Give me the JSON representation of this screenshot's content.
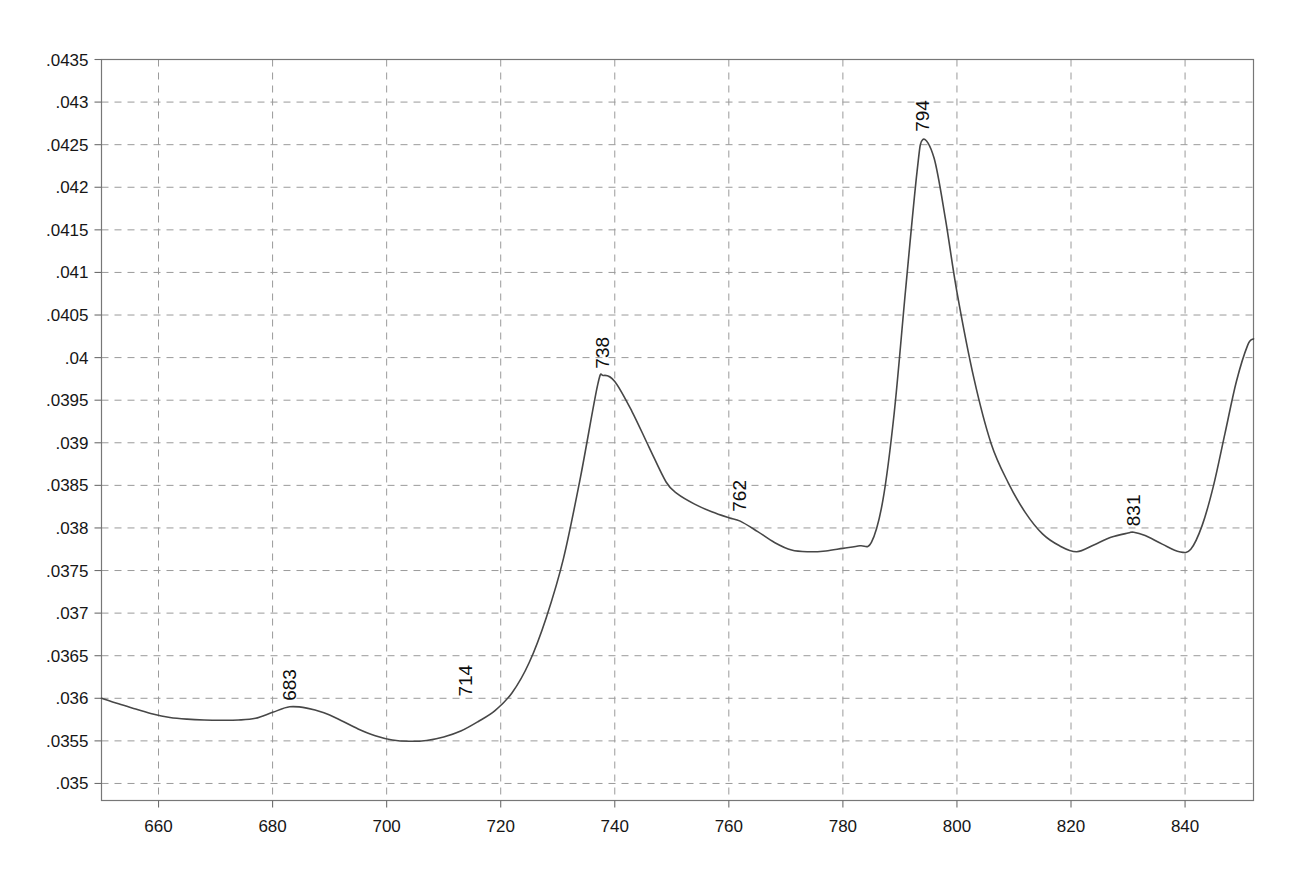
{
  "chart_data": {
    "type": "line",
    "title": "",
    "subtitle": "",
    "xlabel": "",
    "ylabel": "",
    "xlim": [
      650,
      852
    ],
    "ylim": [
      0.0348,
      0.0435
    ],
    "grid": true,
    "legend": null,
    "x_ticks": [
      660,
      680,
      700,
      720,
      740,
      760,
      780,
      800,
      820,
      840
    ],
    "x_tick_labels": [
      "660",
      "680",
      "700",
      "720",
      "740",
      "760",
      "780",
      "800",
      "820",
      "840"
    ],
    "y_ticks": [
      0.035,
      0.0355,
      0.036,
      0.0365,
      0.037,
      0.0375,
      0.038,
      0.0385,
      0.039,
      0.0395,
      0.04,
      0.0405,
      0.041,
      0.0415,
      0.042,
      0.0425,
      0.043,
      0.0435
    ],
    "y_tick_labels": [
      ".035",
      ".0355",
      ".036",
      ".0365",
      ".037",
      ".0375",
      ".038",
      ".0385",
      ".039",
      ".0395",
      ".04",
      ".0405",
      ".041",
      ".0415",
      ".042",
      ".0425",
      ".043",
      ".0435"
    ],
    "annotations": [
      {
        "label": "683",
        "x": 683,
        "y": 0.0359,
        "rotation": -90
      },
      {
        "label": "714",
        "x": 714,
        "y": 0.03595,
        "rotation": -90
      },
      {
        "label": "738",
        "x": 738,
        "y": 0.0398,
        "rotation": -90
      },
      {
        "label": "762",
        "x": 762,
        "y": 0.03812,
        "rotation": -90
      },
      {
        "label": "794",
        "x": 794,
        "y": 0.04258,
        "rotation": -90
      },
      {
        "label": "831",
        "x": 831,
        "y": 0.03795,
        "rotation": -90
      }
    ],
    "series": [
      {
        "name": "spectrum",
        "color": "#474747",
        "x": [
          650,
          653,
          656,
          659,
          662,
          665,
          668,
          671,
          674,
          677,
          680,
          683,
          686,
          689,
          692,
          695,
          698,
          701,
          704,
          707,
          710,
          713,
          716,
          719,
          722,
          725,
          728,
          731,
          734,
          737,
          738,
          740,
          743,
          746,
          749,
          751,
          754,
          757,
          760,
          762,
          765,
          768,
          771,
          774,
          777,
          780,
          783,
          785,
          787,
          789,
          791,
          793,
          794,
          796,
          798,
          800,
          803,
          806,
          809,
          812,
          815,
          818,
          821,
          824,
          827,
          830,
          831,
          833,
          836,
          839,
          841,
          843,
          845,
          847,
          849,
          851,
          852
        ],
        "y": [
          0.036,
          0.035935,
          0.035875,
          0.035815,
          0.035775,
          0.035755,
          0.035745,
          0.035742,
          0.035745,
          0.035765,
          0.035835,
          0.0359,
          0.035885,
          0.03583,
          0.03574,
          0.03564,
          0.03556,
          0.03551,
          0.035495,
          0.035505,
          0.035545,
          0.035615,
          0.035725,
          0.035855,
          0.036065,
          0.03642,
          0.03695,
          0.03764,
          0.0386,
          0.03968,
          0.03979,
          0.03972,
          0.03937,
          0.03895,
          0.03854,
          0.0384,
          0.03828,
          0.03819,
          0.03812,
          0.03808,
          0.03796,
          0.03783,
          0.03774,
          0.03772,
          0.03773,
          0.03776,
          0.03779,
          0.03783,
          0.03832,
          0.03935,
          0.0408,
          0.04218,
          0.04256,
          0.04234,
          0.04162,
          0.04077,
          0.03975,
          0.03899,
          0.03853,
          0.03818,
          0.03793,
          0.03779,
          0.03772,
          0.0378,
          0.03789,
          0.03794,
          0.03795,
          0.03791,
          0.03781,
          0.03772,
          0.03775,
          0.03803,
          0.0385,
          0.03911,
          0.03972,
          0.04015,
          0.04022
        ]
      }
    ]
  },
  "axes": {
    "y_axis_name": "intensity-axis",
    "x_axis_name": "wavelength-axis"
  }
}
